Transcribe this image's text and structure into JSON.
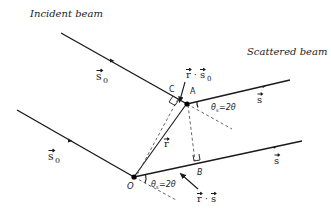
{
  "labels": {
    "incident_beam": "Incident beam",
    "scattered_beam": "Scattered beam",
    "s0_upper": "s",
    "s0_lower": "s",
    "s0_sub": "0",
    "s_upper": "s",
    "s_lower": "s",
    "r": "r",
    "point_A": "A",
    "point_C": "C",
    "point_B": "B",
    "point_O": "O",
    "r_dot_s0_r": "r",
    "r_dot_s0_dot": "·",
    "r_dot_s0_s": "s",
    "r_dot_s_r": "r",
    "r_dot_s_dot": "·",
    "r_dot_s_s": "s",
    "angle_upper": "θ",
    "angle_upper_rest": "=2θ",
    "angle_lower": "θ",
    "angle_lower_rest": "=2θ",
    "angle_sub": "s"
  },
  "colors": {
    "line": "#1a1a1a",
    "dashed": "#555555"
  }
}
